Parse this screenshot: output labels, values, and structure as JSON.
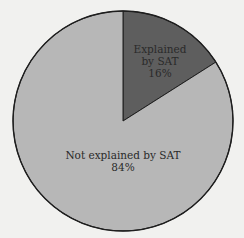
{
  "chart_data": {
    "type": "pie",
    "title": "",
    "categories": [
      "Explained by SAT",
      "Not explained by SAT"
    ],
    "values": [
      16,
      84
    ],
    "unit": "%",
    "colors": [
      "#5e5e5e",
      "#b7b7b7"
    ],
    "start_angle_deg": 0,
    "direction": "clockwise",
    "legend": "none",
    "annotations": [
      {
        "lines": [
          "Explained",
          "by SAT",
          "16%"
        ],
        "slice": 0
      },
      {
        "lines": [
          "Not explained by SAT",
          "84%"
        ],
        "slice": 1
      }
    ]
  },
  "labels": {
    "explained_line1": "Explained",
    "explained_line2": "by SAT",
    "explained_pct": "16%",
    "not_explained_line1": "Not explained by SAT",
    "not_explained_pct": "84%"
  },
  "colors": {
    "background": "#f1f1ef",
    "outline": "#1e1e1e",
    "explained": "#5e5e5e",
    "not_explained": "#b7b7b7"
  }
}
